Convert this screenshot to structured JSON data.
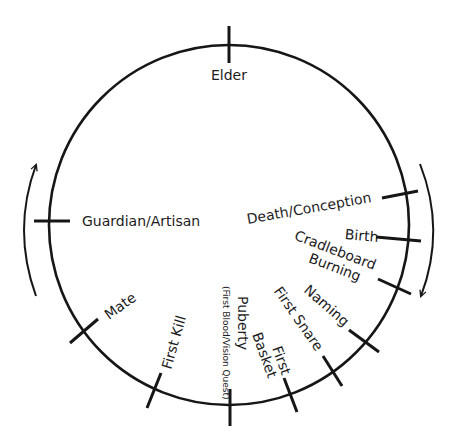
{
  "diagram": {
    "type": "life-cycle-wheel",
    "colors": {
      "line": "#161616",
      "text": "#1c1c1c",
      "background": "#ffffff"
    },
    "circle": {
      "cx": 229,
      "cy": 225,
      "r": 180
    },
    "stages": [
      {
        "id": "elder",
        "label": "Elder",
        "angle_deg": -90
      },
      {
        "id": "death-conception",
        "label": "Death/Conception",
        "angle_deg": -10
      },
      {
        "id": "birth",
        "label": "Birth",
        "angle_deg": 5
      },
      {
        "id": "cradleboard-burning",
        "label_line1": "Cradleboard",
        "label_line2": "Burning",
        "angle_deg": 21
      },
      {
        "id": "naming",
        "label": "Naming",
        "angle_deg": 41
      },
      {
        "id": "first-snare",
        "label": "First Snare",
        "angle_deg": 55
      },
      {
        "id": "first-basket",
        "label_line1": "First",
        "label_line2": "Basket",
        "angle_deg": 70
      },
      {
        "id": "puberty",
        "label": "Puberty",
        "sublabel": "(First Blood/Vision Quest)",
        "angle_deg": 90
      },
      {
        "id": "first-kill",
        "label": "First Kill",
        "angle_deg": 115
      },
      {
        "id": "mate",
        "label": "Mate",
        "angle_deg": 144
      },
      {
        "id": "guardian-artisan",
        "label": "Guardian/Artisan",
        "angle_deg": 181
      }
    ],
    "arrows": [
      {
        "id": "right-arrow",
        "direction": "clockwise-down"
      },
      {
        "id": "left-arrow",
        "direction": "up"
      }
    ]
  }
}
